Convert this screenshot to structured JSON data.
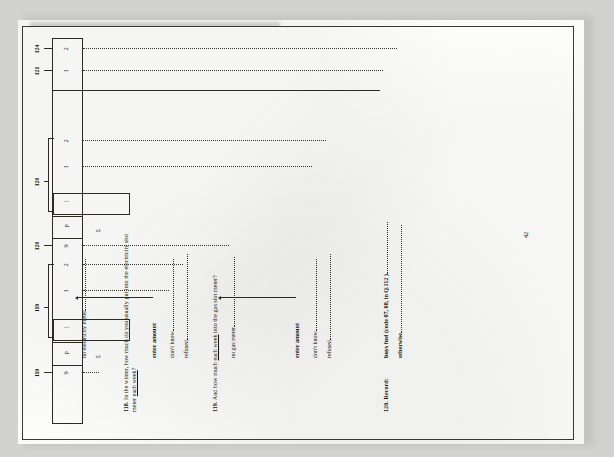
{
  "document": {
    "page_number": "42",
    "type": "survey-questionnaire-page"
  },
  "questions": [
    {
      "number": "118.",
      "text_line1_a": "In the winter, how much do you usually put into the electricity slot",
      "text_line2_a": "meter ",
      "text_line2_underlined": "each week",
      "text_line2_b": "?"
    },
    {
      "number": "119.",
      "text_a": "And how much ",
      "text_underlined": "each week",
      "text_b": " into the gas slot meter?"
    },
    {
      "number": "120.",
      "text": "Record:"
    }
  ],
  "q118": {
    "no_meter_option": "no electricity meter",
    "no_meter_code": "9",
    "no_meter_route": "119",
    "pence_code": "p",
    "amount_label": "enter amount",
    "amount_route": "119",
    "amount_code_bar": "|",
    "pound_symbol": "£",
    "dont_know_label": "don't know",
    "dont_know_code": "1",
    "refused_label": "refused",
    "refused_code": "2"
  },
  "q119": {
    "no_meter_option": "no gas meter",
    "no_meter_code": "9",
    "no_meter_route": "120",
    "pence_code": "p",
    "amount_label": "enter amount",
    "amount_route": "120",
    "amount_code_bar": "|",
    "pound_symbol": "£",
    "dont_know_label": "don't know",
    "dont_know_code": "1",
    "refused_label": "refused",
    "refused_code": "2"
  },
  "q120": {
    "option1_label": "buys fuel (code 07, 08, in Q.112 )",
    "option1_code": "1",
    "option1_route": "121",
    "option2_label": "otherwise",
    "option2_code": "2",
    "option2_route": "124"
  },
  "colors": {
    "ink": "#16160f",
    "rule": "#2b2b24",
    "paper": "#fefefc",
    "scan_background": "#d2d2ce"
  }
}
